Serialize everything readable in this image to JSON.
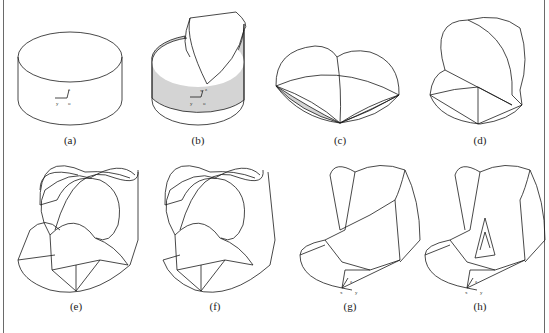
{
  "figure": {
    "panels": [
      {
        "id": "a",
        "label": "(a)",
        "description": "cylinder with local coordinate axes"
      },
      {
        "id": "b",
        "label": "(b)",
        "description": "cylinder with shaded side and raised half-cylinder flap"
      },
      {
        "id": "c",
        "label": "(c)",
        "description": "flattened heart-shaped solid with shaded lower lobes"
      },
      {
        "id": "d",
        "label": "(d)",
        "description": "folded solid with raised lobe"
      },
      {
        "id": "e",
        "label": "(e)",
        "description": "ring-shaped solid, stage 1"
      },
      {
        "id": "f",
        "label": "(f)",
        "description": "ring-shaped solid, stage 2"
      },
      {
        "id": "g",
        "label": "(g)",
        "description": "ring-shaped solid with axes"
      },
      {
        "id": "h",
        "label": "(h)",
        "description": "ring-shaped solid with inner triangular cut and axes"
      }
    ],
    "axes_labels": {
      "x": "x",
      "y": "y",
      "z": "z",
      "o": "o"
    },
    "caption_text": "",
    "colors": {
      "line": "#1a1a1a",
      "shade": "#d4d4d4",
      "frame": "#6a6a6a"
    }
  }
}
